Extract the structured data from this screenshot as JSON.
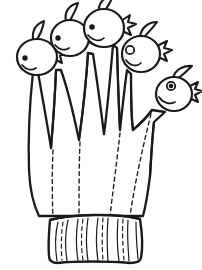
{
  "artwork": {
    "title": "Five-finger puppet glove line drawing",
    "subject": "knitted glove with a fish-head puppet on each fingertip",
    "style": "black ink outline coloring-page artwork on white background",
    "canvas": {
      "width": 202,
      "height": 270,
      "units": "px"
    },
    "colors": {
      "background": "#ffffff",
      "ink": "#1a1a1a",
      "fill": "#ffffff"
    },
    "line": {
      "outline_weight": "2.2",
      "detail_weight": "1.3",
      "stitch_weight": "1.2",
      "stitch_pattern": "dashed"
    }
  },
  "parts": {
    "glove_label": "glove body",
    "cuff_label": "ribbed knit cuff",
    "palm_label": "palm panel",
    "finger_label": "finger tube",
    "head_label": "fish puppet head",
    "crest_label": "head crest fin",
    "tail_label": "star tail fin",
    "eye_label": "eye",
    "mouth_label": "smiling mouth",
    "webbing_label": "thumb webbing notch",
    "seam_label": "dashed stitch seam",
    "rib_label": "cuff rib line"
  },
  "counts": {
    "fingers": 5,
    "heads": 5,
    "palm_seams": 4,
    "cuff_ribs": 9
  },
  "heads": [
    {
      "id": "head-pinky",
      "name": "pinky puppet head",
      "cx": 37,
      "cy": 56,
      "rx": 20,
      "ry": 18,
      "facing": "left",
      "eye": {
        "cx": 24,
        "cy": 57,
        "r": 2.6,
        "style": "dot"
      },
      "crest": "upper-left",
      "tail": "right"
    },
    {
      "id": "head-ring",
      "name": "ring-finger puppet head",
      "cx": 70,
      "cy": 37,
      "rx": 19,
      "ry": 18,
      "facing": "left",
      "eye": {
        "cx": 57,
        "cy": 37,
        "r": 2.6,
        "style": "dot"
      },
      "crest": "top",
      "tail": "right"
    },
    {
      "id": "head-middle",
      "name": "middle-finger puppet head",
      "cx": 104,
      "cy": 28,
      "rx": 20,
      "ry": 19,
      "facing": "left",
      "eye": {
        "cx": 91,
        "cy": 27,
        "r": 2.8,
        "style": "dot"
      },
      "crest": "top",
      "tail": "right"
    },
    {
      "id": "head-index",
      "name": "index-finger puppet head",
      "cx": 141,
      "cy": 53,
      "rx": 19,
      "ry": 18,
      "facing": "left",
      "eye": {
        "cx": 129,
        "cy": 49,
        "r": 4.0,
        "style": "ring"
      },
      "crest": "top-right",
      "tail": "right"
    },
    {
      "id": "head-thumb",
      "name": "thumb puppet head",
      "cx": 174,
      "cy": 93,
      "rx": 18,
      "ry": 17,
      "facing": "left",
      "eye": {
        "cx": 170,
        "cy": 85,
        "r": 3.6,
        "style": "filled-ring"
      },
      "crest": "top-right",
      "tail": "right"
    }
  ],
  "fingers": [
    {
      "id": "finger-pinky",
      "name": "pinky finger tube",
      "tip_x": 42,
      "tip_y": 74,
      "base_x": 52,
      "base_y": 215
    },
    {
      "id": "finger-ring",
      "name": "ring finger tube",
      "tip_x": 73,
      "tip_y": 55,
      "base_x": 78,
      "base_y": 215
    },
    {
      "id": "finger-middle",
      "name": "middle finger tube",
      "tip_x": 104,
      "tip_y": 47,
      "base_x": 100,
      "base_y": 215
    },
    {
      "id": "finger-index",
      "name": "index finger tube",
      "tip_x": 139,
      "tip_y": 71,
      "base_x": 123,
      "base_y": 215
    },
    {
      "id": "finger-thumb",
      "name": "thumb tube",
      "tip_x": 166,
      "tip_y": 110,
      "base_x": 145,
      "base_y": 214
    }
  ],
  "cuff": {
    "name": "ribbed knit cuff",
    "top_y": 215,
    "bottom_y": 262,
    "left_x": 50,
    "right_x": 140,
    "rib_count": 9
  }
}
